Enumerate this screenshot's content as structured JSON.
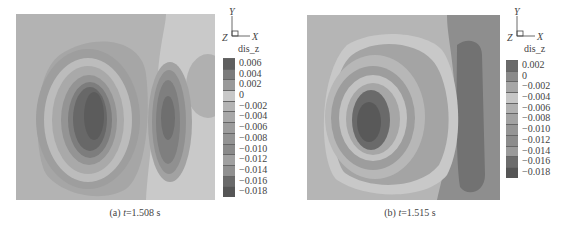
{
  "chart_data": [
    {
      "type": "heatmap",
      "subtype": "filled-contour",
      "caption_prefix": "(a)",
      "caption_var": "t",
      "caption_value": "=1.508 s",
      "variable": "dis_z",
      "axes_triad": {
        "y": "Y",
        "x": "X",
        "z": "Z"
      },
      "legend_levels": [
        "0.006",
        "0.004",
        "0.002",
        "0",
        "−0.002",
        "−0.004",
        "−0.006",
        "−0.008",
        "−0.010",
        "−0.012",
        "−0.014",
        "−0.016",
        "−0.018"
      ],
      "legend_colors": [
        "#5f5f5f",
        "#7c7c7c",
        "#9a9a9a",
        "#c8c8c8",
        "#b4b4b4",
        "#a8a8a8",
        "#9c9c9c",
        "#939393",
        "#8a8a8a",
        "#a0a0a0",
        "#909090",
        "#6a6a6a",
        "#565656"
      ],
      "features": [
        {
          "name": "main-vortex",
          "center": [
            0.38,
            0.5
          ],
          "min_level": -0.018
        },
        {
          "name": "secondary-lobe",
          "center": [
            0.74,
            0.5
          ],
          "min_level": -0.012
        },
        {
          "name": "right-edge-blob",
          "center": [
            0.97,
            0.3
          ],
          "level": -0.002
        }
      ]
    },
    {
      "type": "heatmap",
      "subtype": "filled-contour",
      "caption_prefix": "(b)",
      "caption_var": "t",
      "caption_value": "=1.515 s",
      "variable": "dis_z",
      "axes_triad": {
        "y": "Y",
        "x": "X",
        "z": "Z"
      },
      "legend_levels": [
        "0.002",
        "0",
        "−0.002",
        "−0.004",
        "−0.006",
        "−0.008",
        "−0.010",
        "−0.012",
        "−0.014",
        "−0.016",
        "−0.018"
      ],
      "legend_colors": [
        "#6a6a6a",
        "#8a8a8a",
        "#a6a6a6",
        "#c6c6c6",
        "#b0b0b0",
        "#a2a2a2",
        "#959595",
        "#8c8c8c",
        "#9a9a9a",
        "#6c6c6c",
        "#555555"
      ],
      "features": [
        {
          "name": "main-vortex",
          "center": [
            0.36,
            0.5
          ],
          "min_level": -0.018
        },
        {
          "name": "right-band",
          "center": [
            0.88,
            0.5
          ],
          "level": 0.002
        }
      ]
    }
  ]
}
